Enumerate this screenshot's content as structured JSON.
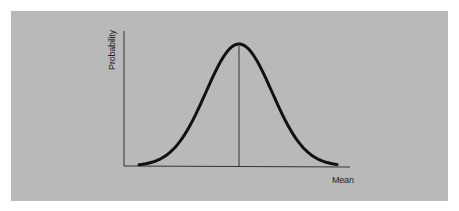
{
  "chart_data": {
    "type": "line",
    "title": "",
    "xlabel": "Mean",
    "ylabel": "Probability",
    "x": [
      -3,
      -2.5,
      -2,
      -1.5,
      -1,
      -0.5,
      0,
      0.5,
      1,
      1.5,
      2,
      2.5,
      3
    ],
    "series": [
      {
        "name": "Normal distribution",
        "values": [
          0.004,
          0.018,
          0.054,
          0.13,
          0.242,
          0.352,
          0.399,
          0.352,
          0.242,
          0.13,
          0.054,
          0.018,
          0.004
        ]
      }
    ],
    "annotations": [
      {
        "type": "vertical-line",
        "x": 0,
        "label": "mean"
      }
    ],
    "grid": false,
    "legend": "none"
  },
  "labels": {
    "y_axis": "Probability",
    "x_axis": "Mean"
  },
  "colors": {
    "background": "#b9b9b9",
    "curve": "#111111",
    "axes": "#333333"
  }
}
